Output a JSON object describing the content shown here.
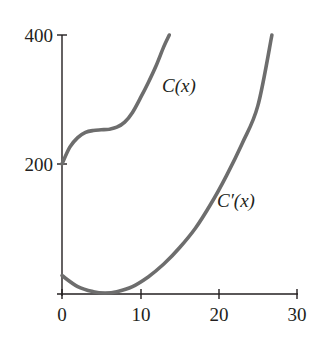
{
  "chart_data": {
    "type": "line",
    "title": "",
    "xlabel": "",
    "ylabel": "",
    "xlim": [
      0,
      30
    ],
    "ylim": [
      0,
      400
    ],
    "x_ticks": [
      0,
      10,
      20,
      30
    ],
    "y_ticks": [
      200,
      400
    ],
    "x_tick_labels": [
      "0",
      "10",
      "20",
      "30"
    ],
    "y_tick_labels": [
      "200",
      "400"
    ],
    "grid": false,
    "legend": "none (curves labeled inline)",
    "series": [
      {
        "name": "C(x)",
        "label": "C(x)",
        "x": [
          0,
          1,
          2,
          3,
          4,
          5,
          6,
          7,
          8,
          9,
          10,
          11,
          12,
          13,
          13.7
        ],
        "values": [
          200,
          226,
          241,
          249,
          252,
          253,
          254,
          257,
          265,
          280,
          302,
          326,
          352,
          382,
          400
        ]
      },
      {
        "name": "C'(x)",
        "label": "C'(x)",
        "x": [
          0,
          2,
          4,
          5.5,
          7,
          9,
          11,
          13,
          15,
          17,
          19,
          21,
          23,
          25,
          26.8
        ],
        "values": [
          27,
          10,
          2,
          0,
          2,
          10,
          25,
          45,
          70,
          100,
          138,
          182,
          232,
          290,
          400
        ]
      }
    ],
    "annotations": [
      {
        "text": "C(x)",
        "near_x": 14.5,
        "near_y": 360
      },
      {
        "text": "C'(x)",
        "near_x": 20.5,
        "near_y": 168
      }
    ]
  },
  "labels": {
    "y400": "400",
    "y200": "200",
    "x0": "0",
    "x10": "10",
    "x20": "20",
    "x30": "30",
    "c_label": "C(x)",
    "cprime_label": "C′(x)"
  },
  "colors": {
    "curve": "#6d6d6d",
    "axis": "#231f20",
    "background": "#ffffff"
  }
}
